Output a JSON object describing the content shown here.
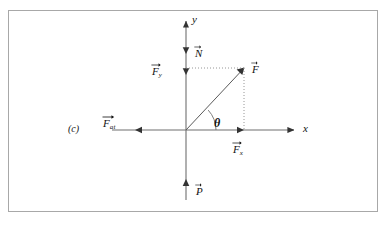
{
  "figure": {
    "panel_label": "(c)",
    "type": "free-body-force-diagram",
    "background_color": "#ffffff",
    "frame_color": "#a8a8a8",
    "stroke_color": "#555555",
    "text_color": "#111111"
  },
  "axes": {
    "x_label": "x",
    "y_label": "y",
    "origin_label": ""
  },
  "vectors": [
    {
      "id": "normal",
      "symbol": "N",
      "subscript": "",
      "label": "N",
      "direction": "up",
      "axis": "y"
    },
    {
      "id": "force-y-component",
      "symbol": "F",
      "subscript": "y",
      "label": "Fy",
      "direction": "up",
      "axis": "y"
    },
    {
      "id": "resultant-force",
      "symbol": "F",
      "subscript": "",
      "label": "F",
      "direction": "up-right",
      "axis": "diagonal"
    },
    {
      "id": "force-x-component",
      "symbol": "F",
      "subscript": "x",
      "label": "Fx",
      "direction": "right",
      "axis": "x"
    },
    {
      "id": "friction-force",
      "symbol": "F",
      "subscript": "at",
      "label": "Fat",
      "direction": "left",
      "axis": "x"
    },
    {
      "id": "weight",
      "symbol": "P",
      "subscript": "",
      "label": "P",
      "direction": "down",
      "axis": "y"
    }
  ],
  "angle": {
    "symbol": "θ",
    "between": "x-axis and resultant force F"
  },
  "geometry": {
    "origin": {
      "x": 186,
      "y": 130
    },
    "y_axis": {
      "x": 186,
      "top": 18,
      "bottom": 200
    },
    "x_axis": {
      "y": 130,
      "left": 112,
      "right": 297
    },
    "normal_tip": {
      "x": 186,
      "y": 47
    },
    "fy_tip": {
      "x": 186,
      "y": 68
    },
    "force_tip": {
      "x": 244,
      "y": 68
    },
    "fx_tip": {
      "x": 244,
      "y": 130
    },
    "friction_tip": {
      "x": 135,
      "y": 130
    },
    "weight_tip": {
      "x": 186,
      "y": 186
    },
    "arc_radius": 30
  }
}
